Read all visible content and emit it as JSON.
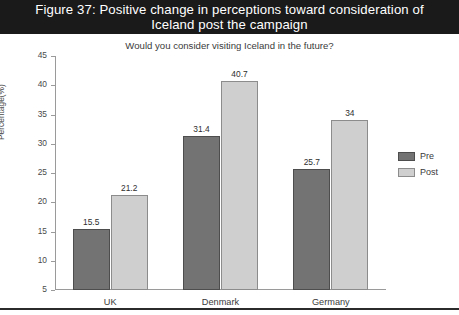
{
  "figure": {
    "title": "Figure 37: Positive change in perceptions toward consideration of\nIceland post the campaign"
  },
  "chart_data": {
    "type": "bar",
    "title": "Would you consider visiting Iceland in the future?",
    "xlabel": "",
    "ylabel": "Percentage(%)",
    "ylim": [
      5,
      45
    ],
    "yticks": [
      5,
      10,
      15,
      20,
      25,
      30,
      35,
      40,
      45
    ],
    "ytick_labels": [
      "5",
      "10",
      "15",
      "20",
      "25",
      "30",
      "35",
      "40",
      "45"
    ],
    "grid": false,
    "legend_position": "right",
    "categories": [
      "UK",
      "Denmark",
      "Germany"
    ],
    "series": [
      {
        "name": "Pre",
        "color": "#737373",
        "values": [
          15.5,
          31.4,
          25.7
        ],
        "labels": [
          "15.5",
          "31.4",
          "25.7"
        ]
      },
      {
        "name": "Post",
        "color": "#cfcfcf",
        "values": [
          21.2,
          40.7,
          34.0
        ],
        "labels": [
          "21.2",
          "40.7",
          "34"
        ]
      }
    ]
  },
  "colors": {
    "header_background": "#1a1a1a",
    "header_text": "#ffffff",
    "pre_fill": "#737373",
    "pre_edge": "#4d4d4d",
    "post_fill": "#cfcfcf",
    "post_edge": "#8c8c8c",
    "axis": "#9a9a9a"
  }
}
